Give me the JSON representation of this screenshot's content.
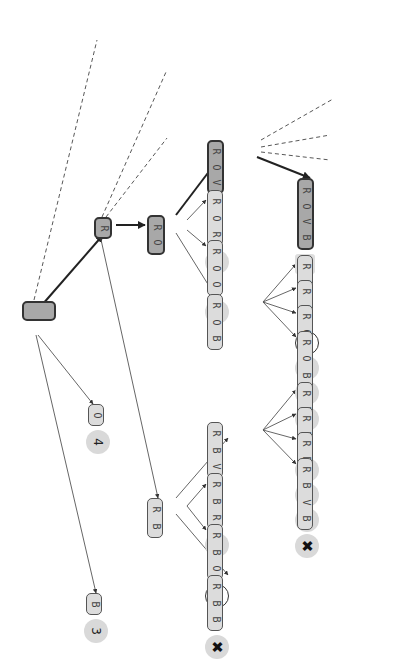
{
  "diagram": {
    "type": "search-tree",
    "orientation": "rotated-90",
    "nodes": [
      {
        "id": "root",
        "label": "",
        "letters": [],
        "style": "dark",
        "x": 22,
        "y": 301,
        "w": 20,
        "h": 34
      },
      {
        "id": "R",
        "letters": [
          "R"
        ],
        "style": "dark",
        "x": 94,
        "y": 217,
        "w": 22,
        "h": 18
      },
      {
        "id": "RO",
        "letters": [
          "R",
          "O"
        ],
        "style": "dark",
        "x": 147,
        "y": 215,
        "w": 40,
        "h": 18
      },
      {
        "id": "ROV",
        "letters": [
          "R",
          "O",
          "V"
        ],
        "style": "dark",
        "x": 207,
        "y": 140,
        "w": 54,
        "h": 17
      },
      {
        "id": "ROVB",
        "letters": [
          "R",
          "O",
          "V",
          "B"
        ],
        "style": "dark",
        "x": 297,
        "y": 178,
        "w": 72,
        "h": 17,
        "badge": {
          "type": "star",
          "text": "☆"
        }
      },
      {
        "id": "ROR",
        "letters": [
          "R",
          "O",
          "R"
        ],
        "style": "light",
        "x": 207,
        "y": 190,
        "w": 56,
        "h": 16,
        "badge": {
          "type": "gray",
          "text": "✖"
        }
      },
      {
        "id": "ROO",
        "letters": [
          "R",
          "O",
          "O"
        ],
        "style": "light",
        "x": 207,
        "y": 240,
        "w": 56,
        "h": 16,
        "badge": {
          "type": "gray",
          "text": "✖"
        }
      },
      {
        "id": "ROB",
        "letters": [
          "R",
          "O",
          "B"
        ],
        "style": "light",
        "x": 207,
        "y": 294,
        "w": 56,
        "h": 16
      },
      {
        "id": "ROBV",
        "letters": [
          "R",
          "O",
          "B",
          "V"
        ],
        "style": "light",
        "x": 297,
        "y": 255,
        "w": 72,
        "h": 16,
        "badge": {
          "type": "open",
          "text": "1"
        }
      },
      {
        "id": "ROBR",
        "letters": [
          "R",
          "O",
          "B",
          "R"
        ],
        "style": "light",
        "x": 297,
        "y": 280,
        "w": 72,
        "h": 16,
        "badge": {
          "type": "gray",
          "text": "✖"
        }
      },
      {
        "id": "ROBO",
        "letters": [
          "R",
          "O",
          "B",
          "O"
        ],
        "style": "light",
        "x": 297,
        "y": 305,
        "w": 72,
        "h": 16,
        "badge": {
          "type": "gray",
          "text": "✖"
        }
      },
      {
        "id": "ROBB",
        "letters": [
          "R",
          "O",
          "B",
          "B"
        ],
        "style": "light",
        "x": 297,
        "y": 331,
        "w": 72,
        "h": 16,
        "badge": {
          "type": "gray",
          "text": "✖"
        }
      },
      {
        "id": "O",
        "letters": [
          "O"
        ],
        "style": "light",
        "x": 88,
        "y": 404,
        "w": 22,
        "h": 16,
        "badge": {
          "type": "gray",
          "text": "4"
        }
      },
      {
        "id": "RB",
        "letters": [
          "R",
          "B"
        ],
        "style": "light",
        "x": 147,
        "y": 498,
        "w": 40,
        "h": 16
      },
      {
        "id": "RBV",
        "letters": [
          "R",
          "B",
          "V"
        ],
        "style": "light",
        "x": 207,
        "y": 422,
        "w": 56,
        "h": 16
      },
      {
        "id": "RBVV",
        "letters": [
          "R",
          "B",
          "V",
          "V"
        ],
        "style": "light",
        "x": 297,
        "y": 382,
        "w": 72,
        "h": 16,
        "badge": {
          "type": "gray",
          "text": "✖"
        }
      },
      {
        "id": "RBVR",
        "letters": [
          "R",
          "B",
          "V",
          "R"
        ],
        "style": "light",
        "x": 297,
        "y": 407,
        "w": 72,
        "h": 16,
        "badge": {
          "type": "gray",
          "text": "✖"
        }
      },
      {
        "id": "RBVO",
        "letters": [
          "R",
          "B",
          "V",
          "O"
        ],
        "style": "light",
        "x": 297,
        "y": 432,
        "w": 72,
        "h": 16,
        "badge": {
          "type": "gray",
          "text": "1"
        }
      },
      {
        "id": "RBVB",
        "letters": [
          "R",
          "B",
          "V",
          "B"
        ],
        "style": "light",
        "x": 297,
        "y": 458,
        "w": 72,
        "h": 16,
        "badge": {
          "type": "gray",
          "text": "✖"
        }
      },
      {
        "id": "RBR",
        "letters": [
          "R",
          "B",
          "R"
        ],
        "style": "light",
        "x": 207,
        "y": 473,
        "w": 56,
        "h": 16,
        "badge": {
          "type": "gray",
          "text": "✖"
        }
      },
      {
        "id": "RBO",
        "letters": [
          "R",
          "B",
          "O"
        ],
        "style": "light",
        "x": 207,
        "y": 524,
        "w": 56,
        "h": 16,
        "badge": {
          "type": "open",
          "text": "3"
        }
      },
      {
        "id": "RBB",
        "letters": [
          "R",
          "B",
          "B"
        ],
        "style": "light",
        "x": 207,
        "y": 575,
        "w": 56,
        "h": 16,
        "badge": {
          "type": "gray",
          "text": "✖"
        }
      },
      {
        "id": "B",
        "letters": [
          "B"
        ],
        "style": "light",
        "x": 86,
        "y": 593,
        "w": 22,
        "h": 16,
        "badge": {
          "type": "gray",
          "text": "3"
        }
      }
    ],
    "edges": [
      {
        "from": [
          42,
          305
        ],
        "to": [
          103,
          235
        ],
        "style": "bold"
      },
      {
        "from": [
          116,
          225
        ],
        "to": [
          145,
          225
        ],
        "style": "bold"
      },
      {
        "from": [
          176,
          215
        ],
        "to": [
          220,
          157
        ],
        "style": "bold"
      },
      {
        "from": [
          257,
          157
        ],
        "to": [
          310,
          178
        ],
        "style": "bold"
      },
      {
        "from": [
          187,
          220
        ],
        "to": [
          206,
          200
        ],
        "style": "thin"
      },
      {
        "from": [
          187,
          230
        ],
        "to": [
          206,
          246
        ],
        "style": "thin"
      },
      {
        "from": [
          176,
          233
        ],
        "to": [
          214,
          294
        ],
        "style": "thin"
      },
      {
        "from": [
          263,
          302
        ],
        "to": [
          296,
          264
        ],
        "style": "thin"
      },
      {
        "from": [
          263,
          302
        ],
        "to": [
          296,
          288
        ],
        "style": "thin"
      },
      {
        "from": [
          263,
          302
        ],
        "to": [
          296,
          313
        ],
        "style": "thin"
      },
      {
        "from": [
          263,
          302
        ],
        "to": [
          296,
          337
        ],
        "style": "thin"
      },
      {
        "from": [
          38,
          335
        ],
        "to": [
          93,
          404
        ],
        "style": "thin"
      },
      {
        "from": [
          36,
          335
        ],
        "to": [
          96,
          593
        ],
        "style": "thin"
      },
      {
        "from": [
          100,
          235
        ],
        "to": [
          158,
          498
        ],
        "style": "thin"
      },
      {
        "from": [
          176,
          498
        ],
        "to": [
          228,
          438
        ],
        "style": "thin"
      },
      {
        "from": [
          187,
          506
        ],
        "to": [
          206,
          484
        ],
        "style": "thin"
      },
      {
        "from": [
          187,
          506
        ],
        "to": [
          206,
          530
        ],
        "style": "thin"
      },
      {
        "from": [
          176,
          514
        ],
        "to": [
          228,
          575
        ],
        "style": "thin"
      },
      {
        "from": [
          263,
          430
        ],
        "to": [
          296,
          390
        ],
        "style": "thin"
      },
      {
        "from": [
          263,
          430
        ],
        "to": [
          296,
          414
        ],
        "style": "thin"
      },
      {
        "from": [
          263,
          430
        ],
        "to": [
          296,
          439
        ],
        "style": "thin"
      },
      {
        "from": [
          263,
          430
        ],
        "to": [
          296,
          464
        ],
        "style": "thin"
      }
    ],
    "dashed_edges": [
      {
        "from": [
          34,
          300
        ],
        "to": [
          97,
          40
        ]
      },
      {
        "from": [
          102,
          217
        ],
        "to": [
          166,
          72
        ]
      },
      {
        "from": [
          106,
          217
        ],
        "to": [
          167,
          138
        ]
      },
      {
        "from": [
          261,
          140
        ],
        "to": [
          333,
          99
        ]
      },
      {
        "from": [
          261,
          147
        ],
        "to": [
          330,
          135
        ]
      },
      {
        "from": [
          261,
          152
        ],
        "to": [
          330,
          160
        ]
      }
    ],
    "offscreen_badge": {
      "type": "gray",
      "x": 404,
      "y": 145
    }
  }
}
